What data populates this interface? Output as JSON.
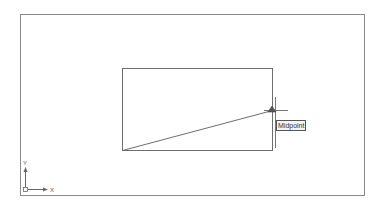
{
  "viewport": {
    "background": "#ffffff",
    "frame_color": "#8a8a8a",
    "line_color": "#6e6e6e"
  },
  "drawing": {
    "objects": [
      {
        "type": "rectangle",
        "name": "rectangle"
      },
      {
        "type": "line",
        "name": "diagonal-line"
      }
    ]
  },
  "snap": {
    "tooltip": "Midpoint",
    "marker": "midpoint-marker",
    "marker_color": "#555555"
  },
  "cursor": {
    "type": "crosshair-cursor"
  },
  "ucs_icon": {
    "x_label": "X",
    "y_label": "Y"
  }
}
